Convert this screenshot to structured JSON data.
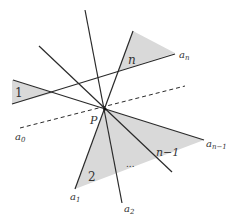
{
  "colors": {
    "line": "#2a2a2a",
    "shade": "#d9d9d9",
    "label": "#333333",
    "background": "#ffffff"
  },
  "point": {
    "name": "P",
    "x": 105,
    "y": 109
  },
  "labels": {
    "a0": "a",
    "a0_sub": "0",
    "a1": "a",
    "a1_sub": "1",
    "a2": "a",
    "a2_sub": "2",
    "an": "a",
    "an_sub": "n",
    "an1": "a",
    "an1_sub": "n−1",
    "P": "P",
    "region_1": "1",
    "region_2": "2",
    "region_n": "n",
    "region_n1": "n−1",
    "ellipsis": "..."
  }
}
